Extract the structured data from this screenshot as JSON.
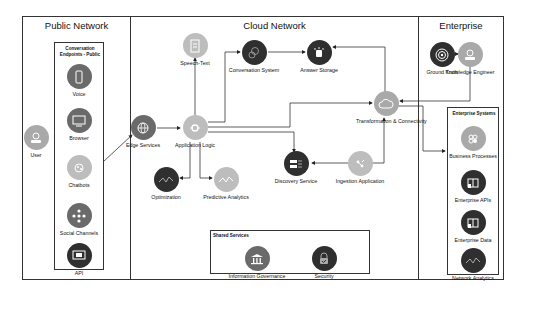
{
  "zones": {
    "public": {
      "title": "Public Network"
    },
    "cloud": {
      "title": "Cloud Network"
    },
    "enterprise": {
      "title": "Enterprise"
    }
  },
  "groups": {
    "endpoints": {
      "title": "Conversation Endpoints - Public"
    },
    "enterprise_systems": {
      "title": "Enterprise Systems"
    },
    "shared_services": {
      "title": "Shared Services"
    }
  },
  "nodes": {
    "user": {
      "label": "User",
      "icon": "user-icon"
    },
    "voice": {
      "label": "Voice",
      "icon": "phone-icon"
    },
    "browser": {
      "label": "Browser",
      "icon": "monitor-icon"
    },
    "chatbots": {
      "label": "Chatbots",
      "icon": "chatbot-icon"
    },
    "social": {
      "label": "Social Channels",
      "icon": "network-icon"
    },
    "api": {
      "label": "API",
      "icon": "api-icon"
    },
    "edge": {
      "label": "Edge Services",
      "icon": "globe-icon"
    },
    "speech": {
      "label": "Speech-Text",
      "icon": "document-icon"
    },
    "app_logic": {
      "label": "Application Logic",
      "icon": "gear-icon"
    },
    "conv_system": {
      "label": "Conversation System",
      "icon": "conversation-icon"
    },
    "answer_storage": {
      "label": "Answer Storage",
      "icon": "database-icon"
    },
    "transformation": {
      "label": "Transformation & Connectivity",
      "icon": "cloud-icon"
    },
    "discovery": {
      "label": "Discovery Service",
      "icon": "search-icon"
    },
    "ingestion": {
      "label": "Ingestion Application",
      "icon": "ingest-icon"
    },
    "optimization": {
      "label": "Optimization",
      "icon": "analytics-icon"
    },
    "predictive": {
      "label": "Predictive Analytics",
      "icon": "analytics-icon"
    },
    "ground_truth": {
      "label": "Ground Truth",
      "icon": "target-icon"
    },
    "knowledge_engineer": {
      "label": "Knowledge Engineer",
      "icon": "user-icon"
    },
    "business_processes": {
      "label": "Business Processes",
      "icon": "process-icon"
    },
    "enterprise_apis": {
      "label": "Enterprise APIs",
      "icon": "api-book-icon"
    },
    "enterprise_data": {
      "label": "Enterprise Data",
      "icon": "data-icon"
    },
    "network_analytics": {
      "label": "Network Analytics",
      "icon": "analytics-icon"
    },
    "info_gov": {
      "label": "Information Governance",
      "icon": "building-icon"
    },
    "security": {
      "label": "Security",
      "icon": "lock-icon"
    }
  }
}
